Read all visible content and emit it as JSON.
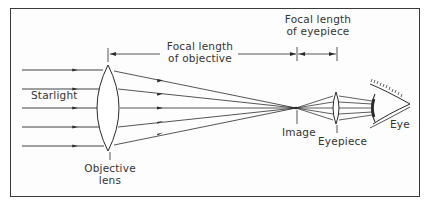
{
  "diagram": {
    "colors": {
      "line": "#2a2a2a",
      "text": "#333333",
      "frame": "#3a3a3a",
      "background": "#ffffff"
    },
    "labels": {
      "starlight": "Starlight",
      "focal_objective_line1": "Focal length",
      "focal_objective_line2": "of objective",
      "focal_eyepiece_line1": "Focal length",
      "focal_eyepiece_line2": "of eyepiece",
      "objective_line1": "Objective",
      "objective_line2": "lens",
      "image": "Image",
      "eyepiece": "Eyepiece",
      "eye": "Eye"
    },
    "incoming_rays": 5,
    "components": [
      "objective-lens",
      "image-point",
      "eyepiece-lens",
      "eye"
    ]
  }
}
